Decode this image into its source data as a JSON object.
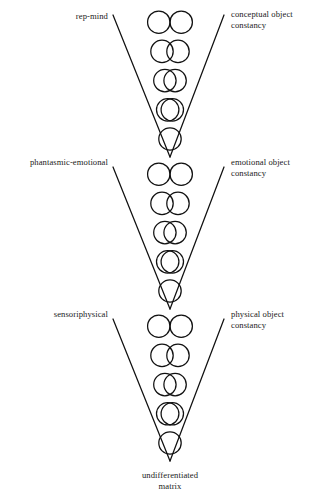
{
  "figure": {
    "title": "",
    "background_color": "#ffffff",
    "stroke_color": "#111111",
    "text_color": "#1a1a1a"
  },
  "levels": [
    {
      "id": "conceptual",
      "left_label": "rep-mind",
      "right_label": "conceptual object\nconstancy",
      "rows": [
        {
          "overlap": "none",
          "description": "two tangent circles"
        },
        {
          "overlap": "slight",
          "description": "two circles slightly overlapping"
        },
        {
          "overlap": "moderate",
          "description": "two circles moderately overlapping"
        },
        {
          "overlap": "heavy",
          "description": "two circles nearly coincident"
        },
        {
          "overlap": "complete",
          "description": "single merged circle"
        }
      ]
    },
    {
      "id": "emotional",
      "left_label": "phantasmic-emotional",
      "right_label": "emotional object\nconstancy",
      "rows": [
        {
          "overlap": "none",
          "description": "two tangent circles"
        },
        {
          "overlap": "slight",
          "description": "two circles slightly overlapping"
        },
        {
          "overlap": "moderate",
          "description": "two circles moderately overlapping"
        },
        {
          "overlap": "heavy",
          "description": "two circles nearly coincident"
        },
        {
          "overlap": "complete",
          "description": "single merged circle"
        }
      ]
    },
    {
      "id": "physical",
      "left_label": "sensoriphysical",
      "right_label": "physical object\nconstancy",
      "rows": [
        {
          "overlap": "none",
          "description": "two tangent circles"
        },
        {
          "overlap": "slight",
          "description": "two circles slightly overlapping"
        },
        {
          "overlap": "moderate",
          "description": "two circles moderately overlapping"
        },
        {
          "overlap": "heavy",
          "description": "two circles nearly coincident"
        },
        {
          "overlap": "complete",
          "description": "single merged circle"
        }
      ]
    }
  ],
  "bottom_label": "undifferentiated\nmatrix",
  "geometry": {
    "groups": [
      {
        "top": 11,
        "apex_y": 157
      },
      {
        "top": 163,
        "apex_y": 309
      },
      {
        "top": 315,
        "apex_y": 461
      }
    ],
    "center_x": 170,
    "circle_radius": 11.2,
    "row_pitch": 29.2,
    "v_left_x": 113,
    "v_right_x": 224,
    "v_top_y": 15,
    "separations": [
      22.4,
      16.0,
      10.2,
      4.6,
      0
    ]
  },
  "labels_positions": {
    "conceptual_left": {
      "x": 18,
      "y": 11,
      "width": 90
    },
    "conceptual_right": {
      "x": 231,
      "y": 9,
      "width": 95
    },
    "emotional_left": {
      "x": 4,
      "y": 157,
      "width": 104
    },
    "emotional_right": {
      "x": 231,
      "y": 157,
      "width": 95
    },
    "physical_left": {
      "x": 18,
      "y": 309,
      "width": 90
    },
    "physical_right": {
      "x": 231,
      "y": 309,
      "width": 95
    },
    "bottom": {
      "x": 108,
      "y": 470,
      "width": 124
    }
  }
}
